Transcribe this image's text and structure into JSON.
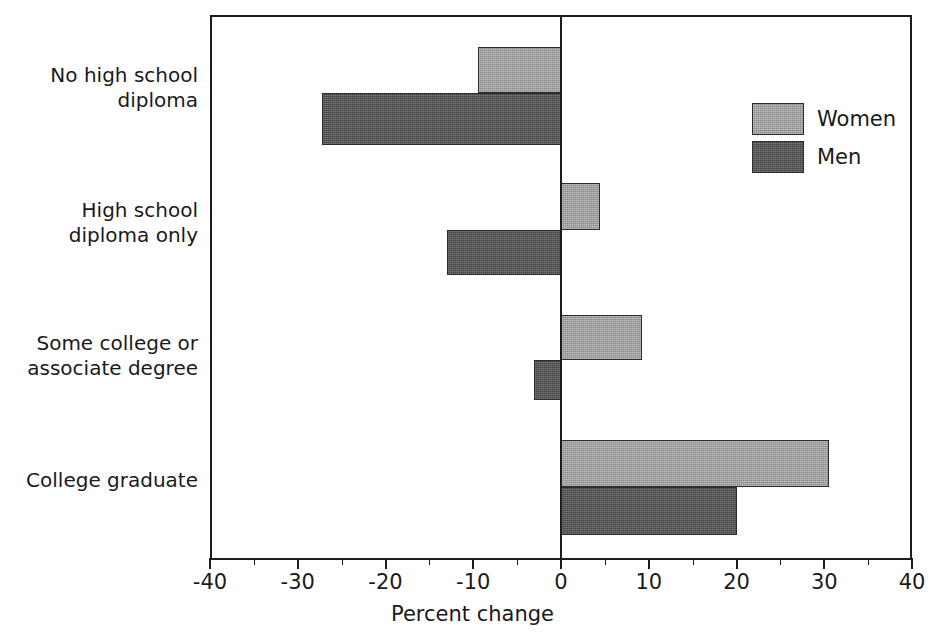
{
  "chart_data": {
    "type": "bar",
    "orientation": "horizontal",
    "title": "",
    "xlabel": "Percent change",
    "ylabel": "",
    "xlim": [
      -40,
      40
    ],
    "xticks": [
      -40,
      -30,
      -20,
      -10,
      0,
      10,
      20,
      30,
      40
    ],
    "xtick_labels": [
      "-40",
      "-30",
      "-20",
      "-10",
      "0",
      "10",
      "20",
      "30",
      "40"
    ],
    "minor_tick_step": 5,
    "grid": false,
    "legend_position": "upper right",
    "categories": [
      "No high school diploma",
      "High school diploma only",
      "Some college or associate degree",
      "College graduate"
    ],
    "category_labels_wrapped": [
      [
        "No high school",
        "diploma"
      ],
      [
        "High school",
        "diploma only"
      ],
      [
        "Some college or",
        "associate degree"
      ],
      [
        "College graduate"
      ]
    ],
    "series": [
      {
        "name": "Women",
        "color": "#9c9c9c",
        "values": [
          -9.5,
          4.5,
          9.2,
          30.5
        ]
      },
      {
        "name": "Men",
        "color": "#555555",
        "values": [
          -27.2,
          -13.0,
          -3.1,
          20.0
        ]
      }
    ]
  },
  "axis": {
    "title": "Percent change"
  },
  "legend": {
    "items": [
      {
        "label": "Women",
        "swatch": "women-swatch"
      },
      {
        "label": "Men",
        "swatch": "men-swatch"
      }
    ]
  }
}
